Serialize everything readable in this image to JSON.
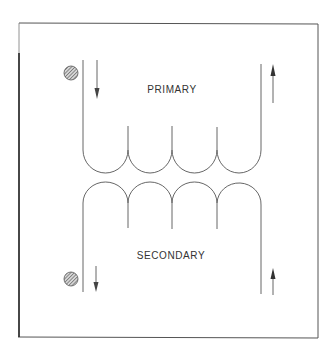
{
  "diagram": {
    "type": "transformer-winding-diagram",
    "windings": [
      {
        "name": "primary",
        "label": "PRIMARY",
        "turns": 4,
        "dot": "top-left",
        "current_in": "down (left lead)",
        "current_out": "up (right lead)"
      },
      {
        "name": "secondary",
        "label": "SECONDARY",
        "turns": 4,
        "dot": "bottom-left",
        "current_in": "down (left lead)",
        "current_out": "up (right lead)"
      }
    ],
    "colors": {
      "line": "#555555",
      "frame": "#444444",
      "dot_fill": "#9a9a9a",
      "text": "#333333"
    }
  }
}
